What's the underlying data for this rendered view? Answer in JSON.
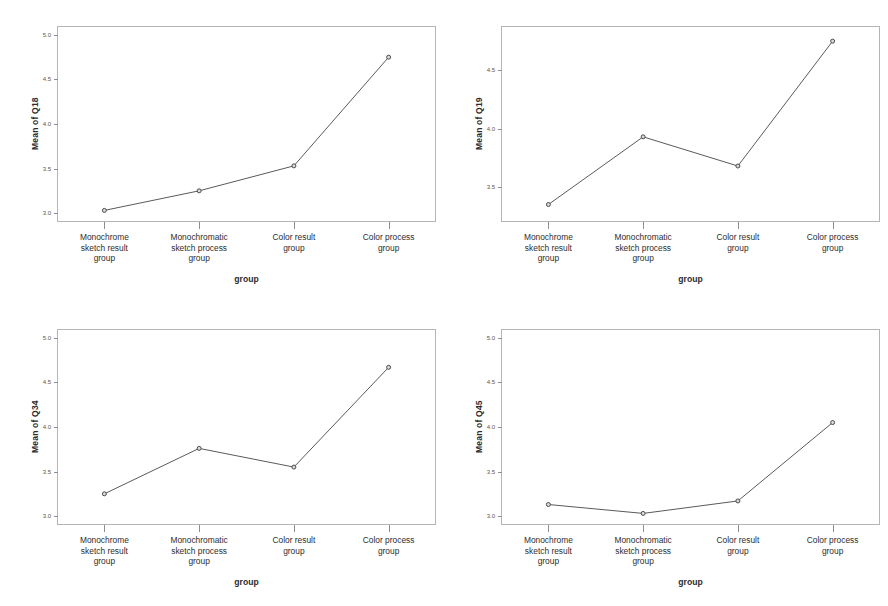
{
  "figure": {
    "panel_count": 4,
    "background": "#ffffff",
    "line_color": "#5a5a5a",
    "marker_fill": "#d9d9d9",
    "marker_stroke": "#4a4a4a",
    "frame_color": "#b5b5b5"
  },
  "categories": [
    "Monochrome\nsketch result\ngroup",
    "Monochromatic\nsketch process\ngroup",
    "Color result\ngroup",
    "Color process\ngroup"
  ],
  "xlabel": "group",
  "chart_data": [
    {
      "type": "line",
      "title": "",
      "ylabel": "Mean of Q18",
      "xlabel": "group",
      "categories": [
        "Monochrome sketch result group",
        "Monochromatic sketch process group",
        "Color result group",
        "Color process group"
      ],
      "values": [
        3.03,
        3.25,
        3.53,
        4.75
      ],
      "yticks": [
        "5.0",
        "4.5",
        "4.0",
        "3.5",
        "3.0"
      ],
      "ytickvalues": [
        5.0,
        4.5,
        4.0,
        3.5,
        3.0
      ],
      "ylim": [
        2.9,
        5.1
      ],
      "grid": false,
      "legend": false
    },
    {
      "type": "line",
      "title": "",
      "ylabel": "Mean of Q19",
      "xlabel": "group",
      "categories": [
        "Monochrome sketch result group",
        "Monochromatic sketch process group",
        "Color result group",
        "Color process group"
      ],
      "values": [
        3.35,
        3.93,
        3.68,
        4.75
      ],
      "yticks": [
        "4.5",
        "4.0",
        "3.5"
      ],
      "ytickvalues": [
        4.5,
        4.0,
        3.5
      ],
      "ylim": [
        3.2,
        4.88
      ],
      "grid": false,
      "legend": false
    },
    {
      "type": "line",
      "title": "",
      "ylabel": "Mean of Q34",
      "xlabel": "group",
      "categories": [
        "Monochrome sketch result group",
        "Monochromatic sketch process group",
        "Color result group",
        "Color process group"
      ],
      "values": [
        3.25,
        3.76,
        3.55,
        4.67
      ],
      "yticks": [
        "5.0",
        "4.5",
        "4.0",
        "3.5",
        "3.0"
      ],
      "ytickvalues": [
        5.0,
        4.5,
        4.0,
        3.5,
        3.0
      ],
      "ylim": [
        2.9,
        5.1
      ],
      "grid": false,
      "legend": false
    },
    {
      "type": "line",
      "title": "",
      "ylabel": "Mean of Q45",
      "xlabel": "group",
      "categories": [
        "Monochrome sketch result group",
        "Monochromatic sketch process group",
        "Color result group",
        "Color process group"
      ],
      "values": [
        3.13,
        3.03,
        3.17,
        4.05
      ],
      "yticks": [
        "5.0",
        "4.5",
        "4.0",
        "3.5",
        "3.0"
      ],
      "ytickvalues": [
        5.0,
        4.5,
        4.0,
        3.5,
        3.0
      ],
      "ylim": [
        2.9,
        5.1
      ],
      "grid": false,
      "legend": false
    }
  ]
}
